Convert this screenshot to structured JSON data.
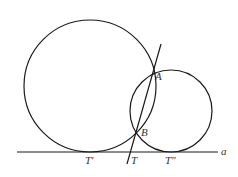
{
  "diagram": {
    "title": "",
    "colors": {
      "stroke": "#1a1a1a",
      "label": "#333333",
      "background": "#ffffff"
    },
    "line_a": {
      "label": "a",
      "x1": 17,
      "y1": 152,
      "x2": 218,
      "y2": 152
    },
    "big_circle": {
      "cx": 90,
      "cy": 86,
      "r": 66
    },
    "small_circle": {
      "cx": 171,
      "cy": 111,
      "r": 41
    },
    "secant": {
      "x1": 161,
      "y1": 44,
      "x2": 127,
      "y2": 164
    },
    "points": {
      "A": {
        "label": "A",
        "x": 152,
        "y": 75
      },
      "B": {
        "label": "B",
        "x": 137,
        "y": 132
      },
      "T_prime": {
        "label": "T'",
        "x": 90,
        "y": 152
      },
      "T": {
        "label": "T",
        "x": 130,
        "y": 152
      },
      "T_double_prime": {
        "label": "T\"",
        "x": 171,
        "y": 152
      }
    }
  }
}
